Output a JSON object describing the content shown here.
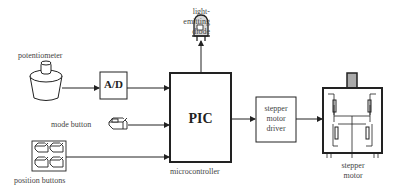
{
  "diagram": {
    "labels": {
      "led": [
        "light-",
        "emitting",
        "diode"
      ],
      "potentiometer": "potentiometer",
      "ad": "A/D",
      "pic": "PIC",
      "microcontroller": "microcontroller",
      "mode_button": "mode button",
      "position_buttons": "position buttons",
      "driver": [
        "stepper",
        "motor",
        "driver"
      ],
      "motor": [
        "stepper",
        "motor"
      ]
    },
    "colors": {
      "stroke": "#222222",
      "text": "#444444",
      "led_fill": "#d8d8d8",
      "shaft_fill": "#aaaaaa"
    }
  }
}
